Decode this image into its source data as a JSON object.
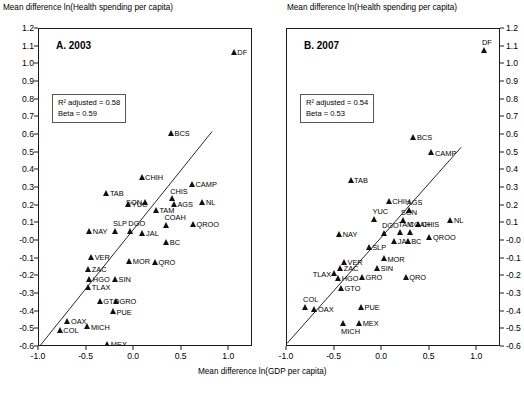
{
  "axes": {
    "ytitle": "Mean difference ln(Health spending per capita)",
    "xtitle": "Mean difference ln(GDP per capita)",
    "yticks": [
      "1.2",
      "1.1",
      "1.0",
      "0.9",
      "0.8",
      "0.7",
      "0.6",
      "0.5",
      "0.4",
      "0.3",
      "0.2",
      "0.1",
      "-0.0",
      "-0.1",
      "-0.2",
      "-0.3",
      "-0.4",
      "-0.5",
      "-0.6"
    ],
    "xticks": [
      "-1.0",
      "-0.5",
      "0.0",
      "0.5",
      "1.0"
    ]
  },
  "chart_data": {
    "type": "scatter",
    "xlabel": "Mean difference ln(GDP per capita)",
    "ylabel": "Mean difference ln(Health spending per capita)",
    "xlim": [
      -1.0,
      1.25
    ],
    "ylim": [
      -0.6,
      1.2
    ],
    "grid": false,
    "legend": "none",
    "panels": [
      {
        "id": "A",
        "label": "A. 2003",
        "annotations": {
          "r2_label": "R² adjusted = 0.58",
          "beta_label": "Beta = 0.59"
        },
        "fit_line": {
          "x": [
            -1.0,
            0.82
          ],
          "y": [
            -0.6,
            0.62
          ]
        },
        "points": [
          {
            "name": "DF",
            "x": 1.05,
            "y": 1.07,
            "pos": "r"
          },
          {
            "name": "BCS",
            "x": 0.39,
            "y": 0.61,
            "pos": "r"
          },
          {
            "name": "CHIH",
            "x": 0.08,
            "y": 0.36,
            "pos": "r"
          },
          {
            "name": "CAMP",
            "x": 0.61,
            "y": 0.32,
            "pos": "r"
          },
          {
            "name": "TAB",
            "x": -0.29,
            "y": 0.27,
            "pos": "r"
          },
          {
            "name": "NL",
            "x": 0.72,
            "y": 0.22,
            "pos": "r"
          },
          {
            "name": "CHIS",
            "x": 0.4,
            "y": 0.24,
            "pos": "t"
          },
          {
            "name": "AGS",
            "x": 0.42,
            "y": 0.21,
            "pos": "r"
          },
          {
            "name": "YUC",
            "x": -0.06,
            "y": 0.21,
            "pos": "r"
          },
          {
            "name": "SON",
            "x": 0.12,
            "y": 0.22,
            "pos": "l"
          },
          {
            "name": "TAM",
            "x": 0.23,
            "y": 0.175,
            "pos": "r"
          },
          {
            "name": "QROO",
            "x": 0.62,
            "y": 0.095,
            "pos": "r"
          },
          {
            "name": "COAH",
            "x": 0.34,
            "y": 0.09,
            "pos": "t"
          },
          {
            "name": "DGO",
            "x": -0.04,
            "y": 0.055,
            "pos": "t"
          },
          {
            "name": "SLP",
            "x": -0.2,
            "y": 0.055,
            "pos": "t"
          },
          {
            "name": "NAY",
            "x": -0.47,
            "y": 0.055,
            "pos": "r"
          },
          {
            "name": "JAL",
            "x": 0.09,
            "y": 0.045,
            "pos": "r"
          },
          {
            "name": "BC",
            "x": 0.34,
            "y": -0.005,
            "pos": "r"
          },
          {
            "name": "VER",
            "x": -0.45,
            "y": -0.09,
            "pos": "r"
          },
          {
            "name": "MOR",
            "x": -0.05,
            "y": -0.115,
            "pos": "r"
          },
          {
            "name": "QRO",
            "x": 0.22,
            "y": -0.12,
            "pos": "r"
          },
          {
            "name": "ZAC",
            "x": -0.48,
            "y": -0.16,
            "pos": "r"
          },
          {
            "name": "HGO",
            "x": -0.47,
            "y": -0.215,
            "pos": "r"
          },
          {
            "name": "SIN",
            "x": -0.2,
            "y": -0.215,
            "pos": "r"
          },
          {
            "name": "TLAX",
            "x": -0.48,
            "y": -0.26,
            "pos": "r"
          },
          {
            "name": "GTO",
            "x": -0.36,
            "y": -0.34,
            "pos": "r"
          },
          {
            "name": "GRO",
            "x": -0.19,
            "y": -0.34,
            "pos": "r"
          },
          {
            "name": "PUE",
            "x": -0.22,
            "y": -0.4,
            "pos": "r"
          },
          {
            "name": "OAX",
            "x": -0.7,
            "y": -0.455,
            "pos": "r"
          },
          {
            "name": "MICH",
            "x": -0.49,
            "y": -0.485,
            "pos": "r"
          },
          {
            "name": "COL",
            "x": -0.78,
            "y": -0.505,
            "pos": "r"
          },
          {
            "name": "MEX",
            "x": -0.28,
            "y": -0.585,
            "pos": "r"
          }
        ]
      },
      {
        "id": "B",
        "label": "B. 2007",
        "annotations": {
          "r2_label": "R² adjusted = 0.54",
          "beta_label": "Beta = 0.53"
        },
        "fit_line": {
          "x": [
            -1.0,
            0.83
          ],
          "y": [
            -0.58,
            0.53
          ]
        },
        "points": [
          {
            "name": "DF",
            "x": 1.07,
            "y": 1.08,
            "pos": "t"
          },
          {
            "name": "BCS",
            "x": 0.33,
            "y": 0.59,
            "pos": "r"
          },
          {
            "name": "CAMP",
            "x": 0.52,
            "y": 0.5,
            "pos": "r"
          },
          {
            "name": "TAB",
            "x": -0.33,
            "y": 0.345,
            "pos": "r"
          },
          {
            "name": "CHIH",
            "x": 0.07,
            "y": 0.225,
            "pos": "r"
          },
          {
            "name": "AGS",
            "x": 0.28,
            "y": 0.175,
            "pos": "t"
          },
          {
            "name": "YUC",
            "x": -0.08,
            "y": 0.125,
            "pos": "t"
          },
          {
            "name": "SON",
            "x": 0.22,
            "y": 0.12,
            "pos": "t"
          },
          {
            "name": "NL",
            "x": 0.72,
            "y": 0.12,
            "pos": "r"
          },
          {
            "name": "CHIS",
            "x": 0.38,
            "y": 0.095,
            "pos": "r"
          },
          {
            "name": "COAH",
            "x": 0.3,
            "y": 0.05,
            "pos": "t"
          },
          {
            "name": "TAM",
            "x": 0.19,
            "y": 0.05,
            "pos": "t"
          },
          {
            "name": "DGO",
            "x": 0.02,
            "y": 0.045,
            "pos": "t"
          },
          {
            "name": "NAY",
            "x": -0.45,
            "y": 0.04,
            "pos": "r"
          },
          {
            "name": "QROO",
            "x": 0.5,
            "y": 0.02,
            "pos": "r"
          },
          {
            "name": "JAL",
            "x": 0.13,
            "y": 0.0,
            "pos": "r"
          },
          {
            "name": "BC",
            "x": 0.27,
            "y": 0.0,
            "pos": "r"
          },
          {
            "name": "SLP",
            "x": -0.14,
            "y": -0.035,
            "pos": "r"
          },
          {
            "name": "MOR",
            "x": 0.02,
            "y": -0.1,
            "pos": "r"
          },
          {
            "name": "VER",
            "x": -0.4,
            "y": -0.12,
            "pos": "r"
          },
          {
            "name": "ZAC",
            "x": -0.44,
            "y": -0.155,
            "pos": "r"
          },
          {
            "name": "SIN",
            "x": -0.05,
            "y": -0.155,
            "pos": "r"
          },
          {
            "name": "TLAX",
            "x": -0.5,
            "y": -0.185,
            "pos": "l"
          },
          {
            "name": "HGO",
            "x": -0.46,
            "y": -0.21,
            "pos": "r"
          },
          {
            "name": "GRO",
            "x": -0.21,
            "y": -0.205,
            "pos": "r"
          },
          {
            "name": "QRO",
            "x": 0.25,
            "y": -0.205,
            "pos": "r"
          },
          {
            "name": "GTO",
            "x": -0.43,
            "y": -0.265,
            "pos": "r"
          },
          {
            "name": "COL",
            "x": -0.81,
            "y": -0.375,
            "pos": "t"
          },
          {
            "name": "OAX",
            "x": -0.71,
            "y": -0.385,
            "pos": "r"
          },
          {
            "name": "PUE",
            "x": -0.22,
            "y": -0.375,
            "pos": "r"
          },
          {
            "name": "MEX",
            "x": -0.24,
            "y": -0.465,
            "pos": "r"
          },
          {
            "name": "MICH",
            "x": -0.41,
            "y": -0.465,
            "pos": "b"
          }
        ]
      }
    ]
  }
}
